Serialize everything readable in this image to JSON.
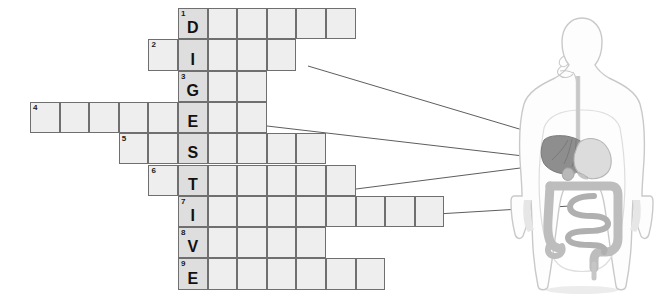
{
  "puzzle": {
    "title": "Digestive system crossword",
    "spine_word": "DIGESTIVE",
    "cell_width": 29.6,
    "cell_height": 31.3,
    "spine_left": 178,
    "grid_top": 8,
    "colors": {
      "cell_fill": "#eeeeee",
      "spine_fill": "#dedede",
      "cell_border": "#6f6f6f",
      "letter": "#111111",
      "leader_line": "#4b4b4b"
    },
    "rows": [
      {
        "number": "1",
        "letter": "D",
        "start_col": 0,
        "length": 6,
        "spine_index": 0
      },
      {
        "number": "2",
        "letter": "I",
        "start_col": -1,
        "length": 5,
        "spine_index": 1
      },
      {
        "number": "3",
        "letter": "G",
        "start_col": 0,
        "length": 3,
        "spine_index": 0
      },
      {
        "number": "4",
        "letter": "E",
        "start_col": -5,
        "length": 8,
        "spine_index": 5
      },
      {
        "number": "5",
        "letter": "S",
        "start_col": -2,
        "length": 7,
        "spine_index": 2
      },
      {
        "number": "6",
        "letter": "T",
        "start_col": -1,
        "length": 7,
        "spine_index": 1
      },
      {
        "number": "7",
        "letter": "I",
        "start_col": 0,
        "length": 9,
        "spine_index": 0
      },
      {
        "number": "8",
        "letter": "V",
        "start_col": 0,
        "length": 5,
        "spine_index": 0
      },
      {
        "number": "9",
        "letter": "E",
        "start_col": 0,
        "length": 7,
        "spine_index": 0
      }
    ]
  },
  "leaders": [
    {
      "name": "leader-row-2",
      "x1": 308,
      "y1": 66,
      "x2": 583,
      "y2": 148
    },
    {
      "name": "leader-row-4",
      "x1": 267,
      "y1": 126,
      "x2": 583,
      "y2": 163
    },
    {
      "name": "leader-row-6",
      "x1": 356,
      "y1": 189,
      "x2": 583,
      "y2": 160
    },
    {
      "name": "leader-row-7",
      "x1": 437,
      "y1": 214,
      "x2": 570,
      "y2": 206
    }
  ],
  "figure": {
    "name": "human-digestive-system-diagram",
    "organs": [
      "mouth",
      "esophagus",
      "liver",
      "stomach",
      "gallbladder",
      "small intestine",
      "large intestine",
      "rectum"
    ],
    "colors": {
      "body_outline": "#c9c9c9",
      "body_fill": "#fdfdfd",
      "liver": "#8e8e8e",
      "stomach": "#d6d6d6",
      "gallbladder": "#b8b8b8",
      "intestine": "#bdbdbd",
      "tract": "#cccccc"
    }
  }
}
